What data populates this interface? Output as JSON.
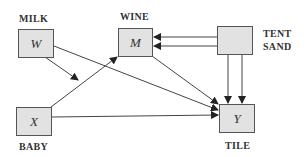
{
  "diagram": {
    "type": "path-diagram",
    "nodes": [
      {
        "id": "W",
        "symbol": "W",
        "label": "MILK"
      },
      {
        "id": "M",
        "symbol": "M",
        "label": "WINE"
      },
      {
        "id": "TS",
        "symbol": "",
        "label_line1": "TENT",
        "label_line2": "SAND"
      },
      {
        "id": "X",
        "symbol": "X",
        "label": "BABY"
      },
      {
        "id": "Y",
        "symbol": "Y",
        "label": "TILE"
      }
    ],
    "edges": [
      {
        "from": "W",
        "to": "X-M path",
        "kind": "moderation"
      },
      {
        "from": "W",
        "to": "Y"
      },
      {
        "from": "X",
        "to": "M"
      },
      {
        "from": "X",
        "to": "Y"
      },
      {
        "from": "M",
        "to": "Y"
      },
      {
        "from": "TS",
        "to": "M",
        "count": 2
      },
      {
        "from": "TS",
        "to": "Y",
        "count": 2
      }
    ],
    "colors": {
      "box_fill": "#e2e2e2",
      "box_border": "#555555",
      "line": "#444444"
    }
  }
}
